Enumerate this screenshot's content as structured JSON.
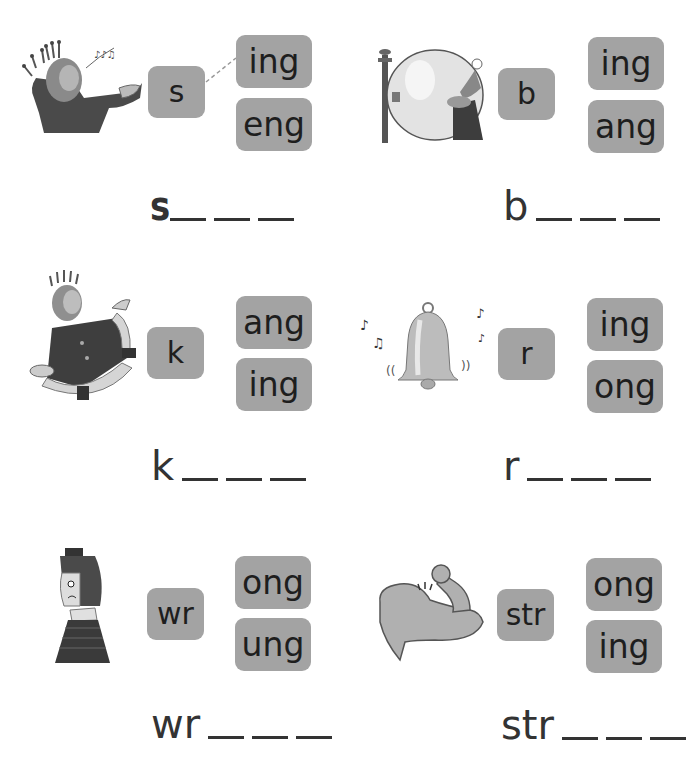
{
  "worksheet": {
    "items": [
      {
        "picture": "singing-king-icon",
        "onset": "s",
        "rimes": [
          "ing",
          "eng"
        ],
        "answer_stem": "s",
        "blanks": 3,
        "connected_rime": "ing"
      },
      {
        "picture": "balloon-icon",
        "onset": "b",
        "rimes": [
          "ing",
          "ang"
        ],
        "answer_stem": "b",
        "blanks": 3
      },
      {
        "picture": "dancing-king-icon",
        "onset": "k",
        "rimes": [
          "ang",
          "ing"
        ],
        "answer_stem": "k",
        "blanks": 3
      },
      {
        "picture": "ringing-bell-icon",
        "onset": "r",
        "rimes": [
          "ing",
          "ong"
        ],
        "answer_stem": "r",
        "blanks": 3
      },
      {
        "picture": "sad-person-icon",
        "onset": "wr",
        "rimes": [
          "ong",
          "ung"
        ],
        "answer_stem": "wr",
        "blanks": 3
      },
      {
        "picture": "flexed-arm-icon",
        "onset": "str",
        "rimes": [
          "ong",
          "ing"
        ],
        "answer_stem": "str",
        "blanks": 3
      }
    ]
  },
  "colors": {
    "tile": "#a3a3a3",
    "text": "#1e1e1e",
    "background": "#ffffff"
  }
}
